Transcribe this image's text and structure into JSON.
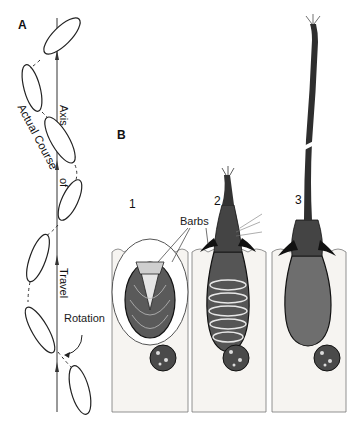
{
  "panels": {
    "A": {
      "letter": "A",
      "labels": {
        "actual_course": "Actual Course",
        "axis": "Axis",
        "of": "of",
        "travel": "Travel",
        "rotation": "Rotation"
      }
    },
    "B": {
      "letter": "B",
      "labels": {
        "barbs": "Barbs",
        "stage1": "1",
        "stage2": "2",
        "stage3": "3"
      }
    }
  },
  "colors": {
    "ink": "#1a1a1a",
    "cell_fill": "#f6f4f1",
    "capsule_fill": "#6e6e6e",
    "nucleus_fill": "#4a4a4a"
  }
}
